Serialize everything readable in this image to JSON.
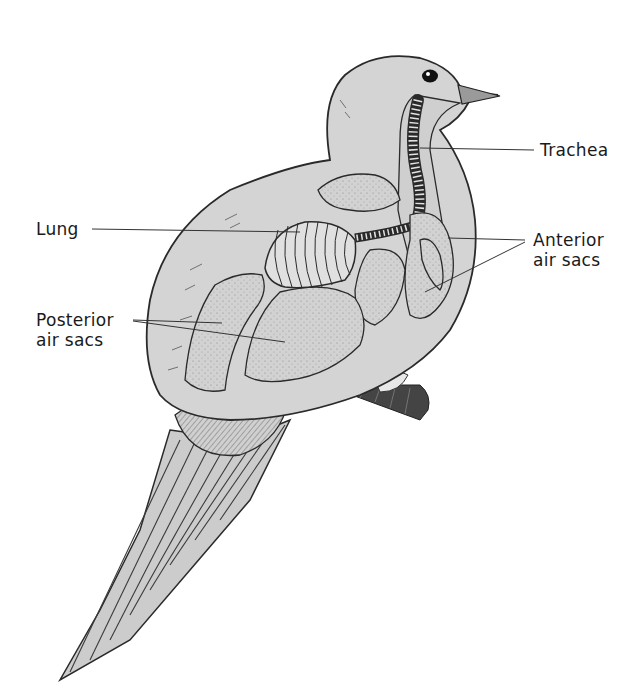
{
  "diagram": {
    "labels": {
      "trachea": "Trachea",
      "lung": "Lung",
      "anterior_line1": "Anterior",
      "anterior_line2": "air sacs",
      "posterior_line1": "Posterior",
      "posterior_line2": "air sacs"
    },
    "colors": {
      "body_fill": "#d4d4d4",
      "organ_fill": "#cfcfcf",
      "outline": "#2a2a2a",
      "leader_line": "#333333",
      "background": "#ffffff"
    }
  }
}
